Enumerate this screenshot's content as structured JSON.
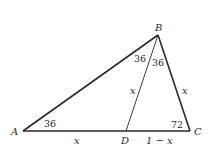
{
  "diagram": {
    "type": "triangle-geometry",
    "colors": {
      "stroke": "#2a2a2a",
      "background": "#ffffff"
    },
    "vertices": {
      "A": {
        "label": "A",
        "x": 23,
        "y": 131
      },
      "B": {
        "label": "B",
        "x": 158,
        "y": 35
      },
      "C": {
        "label": "C",
        "x": 190,
        "y": 131
      },
      "D": {
        "label": "D",
        "x": 126,
        "y": 131
      }
    },
    "segments": [
      {
        "from": "A",
        "to": "B",
        "weight": "thick"
      },
      {
        "from": "B",
        "to": "C",
        "weight": "thick"
      },
      {
        "from": "A",
        "to": "C",
        "weight": "thick"
      },
      {
        "from": "B",
        "to": "D",
        "weight": "thin"
      }
    ],
    "angle_labels": {
      "A": "36",
      "ABD": "36",
      "DBC": "36",
      "C": "72"
    },
    "side_labels": {
      "AD": "x",
      "BD": "x",
      "BC": "x",
      "DC": "1 − x"
    }
  }
}
